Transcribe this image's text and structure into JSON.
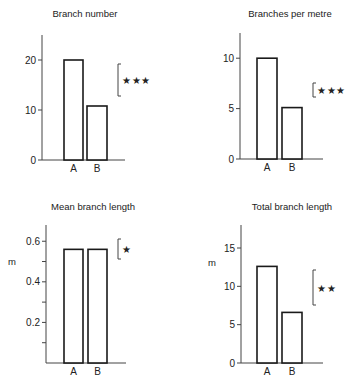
{
  "chart_data": [
    {
      "type": "bar",
      "title": "Branch number",
      "categories": [
        "A",
        "B"
      ],
      "values": [
        20,
        10.8
      ],
      "xlabel": "",
      "ylabel": "",
      "ylim": [
        0,
        25
      ],
      "yticks": [
        0,
        10,
        20
      ],
      "ytick_labels": [
        "0",
        "10",
        "20"
      ],
      "minor_ticks": [],
      "significance": "***",
      "grid": false
    },
    {
      "type": "bar",
      "title": "Branches per metre",
      "categories": [
        "A",
        "B"
      ],
      "values": [
        10,
        5.1
      ],
      "xlabel": "",
      "ylabel": "",
      "ylim": [
        0,
        12.5
      ],
      "yticks": [
        0,
        5,
        10
      ],
      "ytick_labels": [
        "0",
        "5",
        "10"
      ],
      "minor_ticks": [],
      "significance": "***",
      "grid": false
    },
    {
      "type": "bar",
      "title": "Mean branch length",
      "categories": [
        "A",
        "B"
      ],
      "values": [
        0.56,
        0.56
      ],
      "xlabel": "",
      "ylabel": "m",
      "ylim": [
        0,
        0.68
      ],
      "yticks": [
        0.2,
        0.4,
        0.6
      ],
      "ytick_labels": [
        "0.2",
        "0.4",
        "0.6"
      ],
      "minor_ticks": [
        0.1,
        0.3,
        0.5
      ],
      "significance": "*",
      "grid": false
    },
    {
      "type": "bar",
      "title": "Total branch length",
      "categories": [
        "A",
        "B"
      ],
      "values": [
        12.6,
        6.6
      ],
      "xlabel": "",
      "ylabel": "m",
      "ylim": [
        0,
        18
      ],
      "yticks": [
        0,
        5,
        10,
        15
      ],
      "ytick_labels": [
        "0",
        "5",
        "10",
        "15"
      ],
      "minor_ticks": [],
      "significance": "**",
      "grid": false
    }
  ],
  "layout": {
    "panels": [
      {
        "x0": 42,
        "x1": 125,
        "y0": 160,
        "ytop": 35,
        "titleX": 85,
        "titleY": 17,
        "barA": [
          64,
          83
        ],
        "barB": [
          87,
          107
        ],
        "sig": {
          "x": 118,
          "y1": 64,
          "y2": 96
        }
      },
      {
        "x0": 240,
        "x1": 323,
        "y0": 159,
        "ytop": 33,
        "titleX": 290,
        "titleY": 17,
        "barA": [
          257,
          277
        ],
        "barB": [
          282,
          302
        ],
        "sig": {
          "x": 313,
          "y1": 83,
          "y2": 97
        }
      },
      {
        "x0": 46,
        "x1": 126,
        "y0": 363,
        "ytop": 225,
        "titleX": 93,
        "titleY": 210,
        "barA": [
          64,
          83
        ],
        "barB": [
          88,
          107
        ],
        "sig": {
          "x": 118,
          "y1": 239,
          "y2": 259
        },
        "ylabelX": 12,
        "ylabelY": 265
      },
      {
        "x0": 241,
        "x1": 323,
        "y0": 363,
        "ytop": 225,
        "titleX": 292,
        "titleY": 210,
        "barA": [
          257,
          277
        ],
        "barB": [
          282,
          302
        ],
        "sig": {
          "x": 313,
          "y1": 270,
          "y2": 305
        },
        "ylabelX": 212,
        "ylabelY": 266
      }
    ]
  },
  "colors": {
    "ink": "#1a1a1a",
    "bar_fill": "#ffffff",
    "background": "#ffffff"
  }
}
